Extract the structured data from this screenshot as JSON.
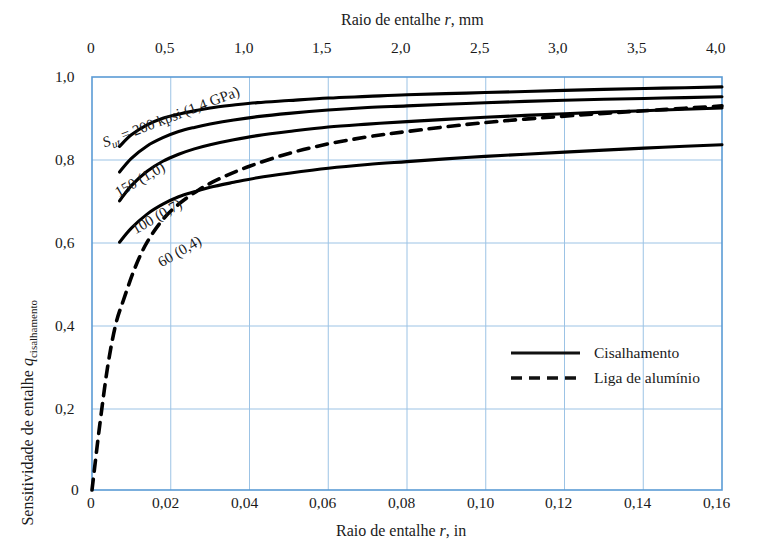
{
  "chart_data": {
    "type": "line",
    "title": "",
    "top_axis": {
      "label_prefix": "Raio de entalhe ",
      "label_italic": "r",
      "label_suffix": ", mm",
      "full_label": "Raio de entalhe r, mm",
      "ticks": [
        "0",
        "0,5",
        "1,0",
        "1,5",
        "2,0",
        "2,5",
        "3,0",
        "3,5",
        "4,0"
      ],
      "tick_values": [
        0,
        0.5,
        1.0,
        1.5,
        2.0,
        2.5,
        3.0,
        3.5,
        4.0
      ],
      "xlim": [
        0,
        4.0
      ],
      "units": "mm"
    },
    "xlabel": "Raio de entalhe r, in",
    "xlabel_prefix": "Raio de entalhe ",
    "xlabel_italic": "r",
    "xlabel_suffix": ", in",
    "xticks": [
      "0",
      "0,02",
      "0,04",
      "0,06",
      "0,08",
      "0,10",
      "0,12",
      "0,14",
      "0,16"
    ],
    "xtick_values": [
      0,
      0.02,
      0.04,
      0.06,
      0.08,
      0.1,
      0.12,
      0.14,
      0.16
    ],
    "xlim": [
      0,
      0.16
    ],
    "ylabel_prefix": "Sensitividade de entalhe ",
    "ylabel_italic": "q",
    "ylabel_sub": "cisalhamento",
    "ylabel": "Sensitividade de entalhe q cisalhamento",
    "yticks": [
      "0",
      "0,2",
      "0,4",
      "0,6",
      "0,8",
      "1,0"
    ],
    "ytick_values": [
      0,
      0.2,
      0.4,
      0.6,
      0.8,
      1.0
    ],
    "ylim": [
      0,
      1.0
    ],
    "grid": true,
    "grid_color": "#7fb4e0",
    "axis_color": "#5b9bd5",
    "curve_color": "#000000",
    "legend_position": "lower right",
    "legend": [
      {
        "label": "Cisalhamento",
        "style": "solid"
      },
      {
        "label": "Liga de alumínio",
        "style": "dashed"
      }
    ],
    "series": [
      {
        "name": "Sut = 200 kpsi (1,4 GPa)",
        "style": "solid",
        "label_text": "S",
        "label_sub": "ut",
        "label_rest": " = 200 kpsi   (1,4 GPa)",
        "x": [
          0.007,
          0.01,
          0.014,
          0.018,
          0.022,
          0.026,
          0.03,
          0.036,
          0.042,
          0.05,
          0.06,
          0.07,
          0.08,
          0.095,
          0.11,
          0.13,
          0.145,
          0.16
        ],
        "y": [
          0.832,
          0.86,
          0.884,
          0.9,
          0.91,
          0.918,
          0.925,
          0.932,
          0.938,
          0.943,
          0.949,
          0.953,
          0.957,
          0.961,
          0.965,
          0.97,
          0.973,
          0.976
        ]
      },
      {
        "name": "150 (1,0)",
        "style": "solid",
        "label_text": "150   (1,0)",
        "x": [
          0.007,
          0.01,
          0.014,
          0.018,
          0.022,
          0.026,
          0.03,
          0.036,
          0.042,
          0.05,
          0.06,
          0.07,
          0.08,
          0.095,
          0.11,
          0.13,
          0.145,
          0.16
        ],
        "y": [
          0.77,
          0.803,
          0.833,
          0.853,
          0.868,
          0.878,
          0.886,
          0.896,
          0.904,
          0.912,
          0.92,
          0.926,
          0.93,
          0.936,
          0.941,
          0.946,
          0.949,
          0.952
        ]
      },
      {
        "name": "100 (0,7)",
        "style": "solid",
        "label_text": "100   (0,7)",
        "x": [
          0.007,
          0.01,
          0.014,
          0.018,
          0.022,
          0.026,
          0.03,
          0.036,
          0.042,
          0.05,
          0.06,
          0.07,
          0.08,
          0.095,
          0.11,
          0.13,
          0.145,
          0.16
        ],
        "y": [
          0.7,
          0.737,
          0.772,
          0.796,
          0.813,
          0.826,
          0.836,
          0.848,
          0.858,
          0.868,
          0.879,
          0.886,
          0.892,
          0.9,
          0.907,
          0.915,
          0.92,
          0.925
        ]
      },
      {
        "name": "60 (0,4)",
        "style": "solid",
        "x": [
          0.007,
          0.01,
          0.014,
          0.018,
          0.022,
          0.026,
          0.03,
          0.036,
          0.042,
          0.05,
          0.06,
          0.07,
          0.08,
          0.095,
          0.11,
          0.13,
          0.145,
          0.16
        ],
        "y": [
          0.6,
          0.634,
          0.668,
          0.692,
          0.71,
          0.722,
          0.733,
          0.745,
          0.756,
          0.767,
          0.779,
          0.788,
          0.795,
          0.805,
          0.813,
          0.823,
          0.83,
          0.836
        ],
        "label_text": "60   (0,4)"
      },
      {
        "name": "Liga de alumínio",
        "style": "dashed",
        "x": [
          0.0,
          0.002,
          0.004,
          0.006,
          0.008,
          0.011,
          0.014,
          0.018,
          0.022,
          0.027,
          0.032,
          0.04,
          0.05,
          0.06,
          0.07,
          0.08,
          0.095,
          0.11,
          0.13,
          0.145,
          0.16
        ],
        "y": [
          0.0,
          0.16,
          0.3,
          0.4,
          0.46,
          0.54,
          0.6,
          0.655,
          0.692,
          0.726,
          0.752,
          0.784,
          0.815,
          0.838,
          0.855,
          0.868,
          0.885,
          0.898,
          0.912,
          0.921,
          0.93
        ]
      }
    ]
  },
  "curve_labels": {
    "sut_prefix": "S",
    "sut_sub": "ut",
    "sut_rest": " = 200 kpsi   (1,4 GPa)",
    "l150": "150   (1,0)",
    "l100": "100   (0,7)",
    "l60": "60   (0,4)"
  },
  "legend_items": {
    "solid_label": "Cisalhamento",
    "dashed_label": "Liga de alumínio"
  }
}
